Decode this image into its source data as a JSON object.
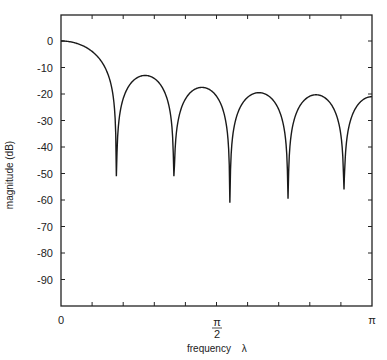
{
  "chart_data": {
    "type": "line",
    "title": "",
    "xlabel": "frequency λ",
    "ylabel": "magnitude (dB)",
    "xlim": [
      0,
      3.14159
    ],
    "ylim": [
      -100,
      10
    ],
    "grid": false,
    "legend": null,
    "x_tick_labels": [
      {
        "value": 0,
        "label": "0"
      },
      {
        "value": 1.5708,
        "label": "π/2",
        "numerator": "π",
        "denominator": "2"
      },
      {
        "value": 3.14159,
        "label": "π"
      }
    ],
    "y_ticks": [
      0,
      -10,
      -20,
      -30,
      -40,
      -50,
      -60,
      -70,
      -80,
      -90
    ],
    "y_tick_labels": [
      "0",
      "-10",
      "-20",
      "-30",
      "-40",
      "-50",
      "-60",
      "-70",
      "-80",
      "-90"
    ],
    "nulls": [
      {
        "x_over_pi": 0.178,
        "db": -51
      },
      {
        "x_over_pi": 0.363,
        "db": -51
      },
      {
        "x_over_pi": 0.543,
        "db": -61
      },
      {
        "x_over_pi": 0.73,
        "db": -59.5
      },
      {
        "x_over_pi": 0.91,
        "db": -56
      }
    ],
    "sidelobe_peaks": [
      {
        "x_over_pi": 0.0,
        "db": 0
      },
      {
        "x_over_pi": 0.264,
        "db": -13
      },
      {
        "x_over_pi": 0.447,
        "db": -17.5
      },
      {
        "x_over_pi": 0.637,
        "db": -19.5
      },
      {
        "x_over_pi": 0.81,
        "db": -20.3
      },
      {
        "x_over_pi": 1.0,
        "db": -21
      }
    ],
    "series": [
      {
        "name": "magnitude response",
        "color": "#1a1a1a"
      }
    ]
  },
  "axes": {
    "x_label_text": "frequency",
    "x_label_symbol": "λ",
    "y_label_text": "magnitude (dB)"
  }
}
